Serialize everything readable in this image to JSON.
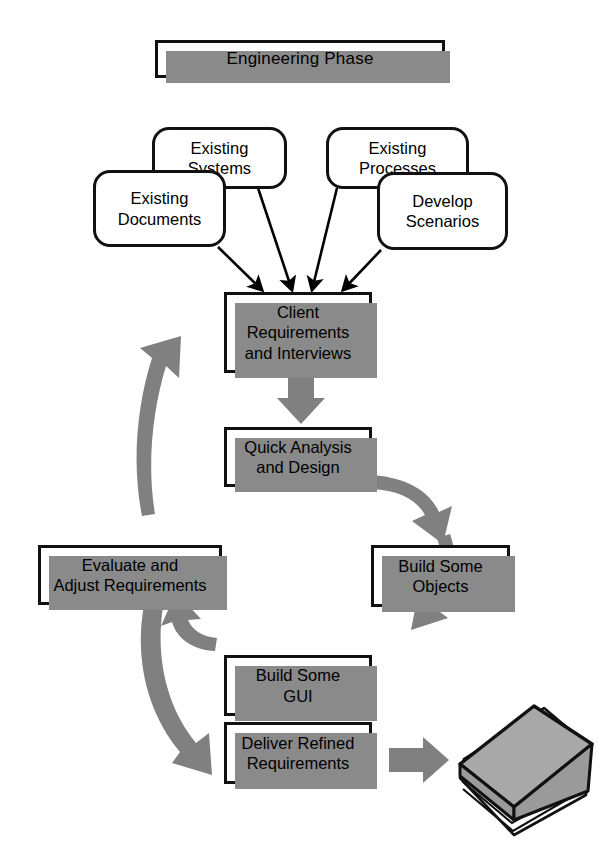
{
  "diagram": {
    "title": "Engineering Phase",
    "type": "flowchart",
    "style": {
      "box_border": "#111111",
      "box_fill": "#ffffff",
      "shadow": "#8a8a8a",
      "thick_arrow": "#808080",
      "thin_arrow": "#000000",
      "book_cover": "#a8a8a8",
      "background": "#ffffff"
    },
    "nodes": {
      "title": {
        "label": "Engineering Phase",
        "shape": "rectangle"
      },
      "existing_systems": {
        "label": "Existing\nSystems",
        "shape": "rounded"
      },
      "existing_processes": {
        "label": "Existing\nProcesses",
        "shape": "rounded"
      },
      "existing_documents": {
        "label": "Existing\nDocuments",
        "shape": "rounded"
      },
      "develop_scenarios": {
        "label": "Develop\nScenarios",
        "shape": "rounded"
      },
      "client_requirements": {
        "label": "Client\nRequirements\nand Interviews",
        "shape": "rectangle"
      },
      "quick_analysis": {
        "label": "Quick Analysis\nand Design",
        "shape": "rectangle"
      },
      "evaluate": {
        "label": "Evaluate and\nAdjust Requirements",
        "shape": "rectangle"
      },
      "build_objects": {
        "label": "Build Some\nObjects",
        "shape": "rectangle"
      },
      "build_gui": {
        "label": "Build Some\nGUI",
        "shape": "rectangle"
      },
      "deliver": {
        "label": "Deliver Refined\nRequirements",
        "shape": "rectangle"
      },
      "book": {
        "label": "book-document",
        "shape": "book-icon"
      }
    },
    "edges": [
      {
        "from": "existing_systems",
        "to": "client_requirements",
        "style": "thin-arrow"
      },
      {
        "from": "existing_processes",
        "to": "client_requirements",
        "style": "thin-arrow"
      },
      {
        "from": "existing_documents",
        "to": "client_requirements",
        "style": "thin-arrow"
      },
      {
        "from": "develop_scenarios",
        "to": "client_requirements",
        "style": "thin-arrow"
      },
      {
        "from": "client_requirements",
        "to": "quick_analysis",
        "style": "thick-gray-arrow"
      },
      {
        "from": "quick_analysis",
        "to": "build_objects",
        "style": "thick-gray-curve"
      },
      {
        "from": "build_objects",
        "to": "build_gui",
        "style": "thick-gray-curve"
      },
      {
        "from": "build_gui",
        "to": "evaluate",
        "style": "thick-gray-curve"
      },
      {
        "from": "evaluate",
        "to": "client_requirements",
        "style": "thick-gray-curve"
      },
      {
        "from": "evaluate",
        "to": "deliver",
        "style": "thick-gray-curve"
      },
      {
        "from": "deliver",
        "to": "book",
        "style": "thick-gray-arrow"
      }
    ]
  }
}
